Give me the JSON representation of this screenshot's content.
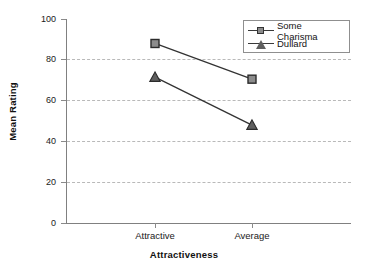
{
  "chart_data": {
    "type": "line",
    "title": "",
    "xlabel": "Attractiveness",
    "ylabel": "Mean Rating",
    "categories": [
      "Attractive",
      "Average"
    ],
    "ylim": [
      0,
      100
    ],
    "yticks": [
      0,
      20,
      40,
      60,
      80,
      100
    ],
    "ytick_labels": [
      "0",
      "20",
      "40",
      "60",
      "80",
      "100"
    ],
    "grid": "horizontal-dashed",
    "legend_position": "top-right",
    "series": [
      {
        "name": "Some Charisma",
        "values": [
          88,
          70.5
        ],
        "marker": "square",
        "color": "#8c8c8c"
      },
      {
        "name": "Dullard",
        "values": [
          71.5,
          48
        ],
        "marker": "triangle",
        "color": "#5f5f5f"
      }
    ]
  },
  "axes": {
    "y_label": "Mean Rating",
    "x_label": "Attractiveness",
    "y_tick_0": "0",
    "y_tick_1": "20",
    "y_tick_2": "40",
    "y_tick_3": "60",
    "y_tick_4": "80",
    "y_tick_5": "100",
    "x_tick_0": "Attractive",
    "x_tick_1": "Average"
  },
  "legend": {
    "items": [
      {
        "label": "Some Charisma"
      },
      {
        "label": "Dullard"
      }
    ]
  }
}
